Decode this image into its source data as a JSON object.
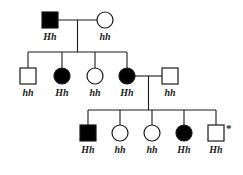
{
  "diagram": {
    "type": "pedigree-chart",
    "title": "",
    "colors": {
      "affected_fill": "#000000",
      "unaffected_fill": "#ffffff",
      "stroke": "#1a1a1a",
      "background": "#ffffff",
      "label_color": "#1a1a1a"
    },
    "legend": {
      "square_meaning": "male",
      "circle_meaning": "female",
      "filled_meaning": "affected",
      "open_meaning": "unaffected",
      "asterisk_meaning": "*"
    },
    "generations": [
      {
        "id": "I",
        "individuals": [
          {
            "id": "I-1",
            "shape": "square",
            "status": "filled",
            "sex": "male",
            "genotype": "Hh",
            "cx": 50,
            "cy": 20,
            "marked": false
          },
          {
            "id": "I-2",
            "shape": "circle",
            "status": "open",
            "sex": "female",
            "genotype": "hh",
            "cx": 105,
            "cy": 20,
            "marked": false
          }
        ]
      },
      {
        "id": "II",
        "individuals": [
          {
            "id": "II-1",
            "shape": "square",
            "status": "open",
            "sex": "male",
            "genotype": "hh",
            "cx": 28,
            "cy": 76,
            "marked": false
          },
          {
            "id": "II-2",
            "shape": "circle",
            "status": "filled",
            "sex": "female",
            "genotype": "Hh",
            "cx": 62,
            "cy": 76,
            "marked": false
          },
          {
            "id": "II-3",
            "shape": "circle",
            "status": "open",
            "sex": "female",
            "genotype": "hh",
            "cx": 95,
            "cy": 76,
            "marked": false
          },
          {
            "id": "II-4",
            "shape": "circle",
            "status": "filled",
            "sex": "female",
            "genotype": "Hh",
            "cx": 127,
            "cy": 76,
            "marked": false
          },
          {
            "id": "II-5",
            "shape": "square",
            "status": "open",
            "sex": "male",
            "genotype": "hh",
            "cx": 170,
            "cy": 76,
            "marked": false
          }
        ]
      },
      {
        "id": "III",
        "individuals": [
          {
            "id": "III-1",
            "shape": "square",
            "status": "filled",
            "sex": "male",
            "genotype": "Hh",
            "cx": 88,
            "cy": 133,
            "marked": false
          },
          {
            "id": "III-2",
            "shape": "circle",
            "status": "open",
            "sex": "female",
            "genotype": "hh",
            "cx": 120,
            "cy": 133,
            "marked": false
          },
          {
            "id": "III-3",
            "shape": "circle",
            "status": "open",
            "sex": "female",
            "genotype": "hh",
            "cx": 152,
            "cy": 133,
            "marked": false
          },
          {
            "id": "III-4",
            "shape": "circle",
            "status": "filled",
            "sex": "female",
            "genotype": "Hh",
            "cx": 184,
            "cy": 133,
            "marked": false
          },
          {
            "id": "III-5",
            "shape": "square",
            "status": "open",
            "sex": "male",
            "genotype": "Hh",
            "cx": 216,
            "cy": 133,
            "marked": true
          }
        ]
      }
    ],
    "matings": [
      {
        "id": "mating-1",
        "partners": [
          "I-1",
          "I-2"
        ],
        "line_y": 20,
        "x1": 58,
        "x2": 97,
        "descent_x": 77.5
      },
      {
        "id": "mating-2",
        "partners": [
          "II-4",
          "II-5"
        ],
        "line_y": 76,
        "x1": 135,
        "x2": 162,
        "descent_x": 148.5
      }
    ],
    "sibships": [
      {
        "id": "sibship-1",
        "parents": "mating-1",
        "line_y": 52,
        "x1": 28,
        "x2": 127,
        "children": [
          "II-1",
          "II-2",
          "II-3",
          "II-4"
        ]
      },
      {
        "id": "sibship-2",
        "parents": "mating-2",
        "line_y": 110,
        "x1": 88,
        "x2": 216,
        "children": [
          "III-1",
          "III-2",
          "III-3",
          "III-4",
          "III-5"
        ]
      }
    ]
  },
  "labels": {
    "i_1": "Hh",
    "i_2": "hh",
    "ii_1": "hh",
    "ii_2": "Hh",
    "ii_3": "hh",
    "ii_4": "Hh",
    "ii_5": "hh",
    "iii_1": "Hh",
    "iii_2": "hh",
    "iii_3": "hh",
    "iii_4": "Hh",
    "iii_5": "Hh",
    "asterisk": "*"
  }
}
